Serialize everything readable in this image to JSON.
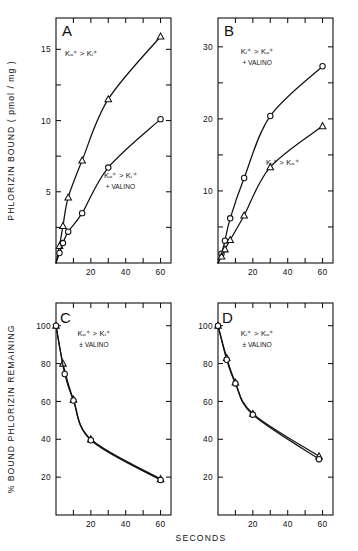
{
  "figure": {
    "x_axis_label": "SECONDS",
    "panels": [
      "A",
      "B",
      "C",
      "D"
    ]
  },
  "chart_data": [
    {
      "type": "line",
      "panel": "A",
      "title": "A",
      "xlabel": "SECONDS",
      "ylabel": "PHLORIZIN BOUND ( pmol / mg )",
      "xlim": [
        0,
        66
      ],
      "ylim": [
        0,
        17.2
      ],
      "xticks": [
        10,
        20,
        30,
        40,
        50,
        60
      ],
      "xticklabels": [
        "",
        "20",
        "",
        "40",
        "",
        "60"
      ],
      "yticks": [
        2.5,
        5,
        7.5,
        10,
        12.5,
        15
      ],
      "yticklabels": [
        "",
        "5",
        "",
        "10",
        "",
        "15"
      ],
      "grid": false,
      "legend": "none",
      "series": [
        {
          "name": "Kₒ⁺ > Kᵢ⁺",
          "marker": "triangle",
          "annotation": "Kₒ⁺ > Kᵢ⁺",
          "x": [
            0,
            2,
            4,
            7,
            15,
            30,
            60
          ],
          "y": [
            0,
            1.2,
            2.6,
            4.6,
            7.2,
            11.5,
            15.9
          ]
        },
        {
          "name": "Kₒ⁺ > Kᵢ⁺ + VALINO",
          "marker": "circle",
          "annotation": "Kₒ⁺ > Kᵢ⁺",
          "annotation2": "+ VALINO",
          "x": [
            0,
            2,
            4,
            7,
            15,
            30,
            60
          ],
          "y": [
            0,
            0.7,
            1.4,
            2.2,
            3.5,
            6.7,
            10.1
          ]
        }
      ]
    },
    {
      "type": "line",
      "panel": "B",
      "title": "B",
      "xlabel": "SECONDS",
      "ylabel": "PHLORIZIN BOUND ( pmol / mg )",
      "xlim": [
        0,
        66
      ],
      "ylim": [
        0,
        34
      ],
      "xticks": [
        10,
        20,
        30,
        40,
        50,
        60
      ],
      "xticklabels": [
        "",
        "20",
        "",
        "40",
        "",
        "60"
      ],
      "yticks": [
        5,
        10,
        15,
        20,
        25,
        30
      ],
      "yticklabels": [
        "",
        "10",
        "",
        "20",
        "",
        "30"
      ],
      "grid": false,
      "legend": "none",
      "series": [
        {
          "name": "Kᵢ⁺ > Kₒ⁺ + VALINO",
          "marker": "circle",
          "annotation": "Kᵢ⁺ > Kₒ⁺",
          "annotation2": "+ VALINO",
          "x": [
            0,
            2,
            4,
            7,
            15,
            30,
            60
          ],
          "y": [
            0,
            1.3,
            3.1,
            6.2,
            11.8,
            20.4,
            27.3
          ]
        },
        {
          "name": "Kᵢ⁺ > Kₒ⁺",
          "marker": "triangle",
          "annotation": "Kᵢ⁺ > Kₒ⁺",
          "x": [
            0,
            2,
            4,
            7,
            15,
            30,
            60
          ],
          "y": [
            0,
            0.9,
            1.9,
            3.2,
            6.6,
            13.3,
            19.0
          ]
        }
      ]
    },
    {
      "type": "line",
      "panel": "C",
      "title": "C",
      "xlabel": "SECONDS",
      "ylabel": "% BOUND PHLORIZIN REMAINING",
      "xlim": [
        0,
        66
      ],
      "ylim": [
        0,
        112
      ],
      "xticks": [
        10,
        20,
        30,
        40,
        50,
        60
      ],
      "xticklabels": [
        "",
        "20",
        "",
        "40",
        "",
        "60"
      ],
      "yticks": [
        20,
        40,
        60,
        80,
        100
      ],
      "yticklabels": [
        "20",
        "40",
        "60",
        "80",
        "100"
      ],
      "grid": false,
      "legend": "none",
      "series": [
        {
          "name": "Kₒ⁺ > Kᵢ⁺ ± VALINO (triangles)",
          "marker": "triangle",
          "annotation": "Kₒ⁺ > Kᵢ⁺",
          "annotation2": "± VALINO",
          "x": [
            0,
            4,
            10,
            20,
            60
          ],
          "y": [
            100,
            80,
            61,
            40,
            19
          ]
        },
        {
          "name": "Kₒ⁺ > Kᵢ⁺ ± VALINO (circles)",
          "marker": "circle",
          "x": [
            0,
            5,
            10,
            20,
            60
          ],
          "y": [
            100,
            74.5,
            60.5,
            39.5,
            18.5
          ]
        }
      ]
    },
    {
      "type": "line",
      "panel": "D",
      "title": "D",
      "xlabel": "SECONDS",
      "ylabel": "% BOUND PHLORIZIN REMAINING",
      "xlim": [
        0,
        66
      ],
      "ylim": [
        0,
        112
      ],
      "xticks": [
        10,
        20,
        30,
        40,
        50,
        60
      ],
      "xticklabels": [
        "",
        "20",
        "",
        "40",
        "",
        "60"
      ],
      "yticks": [
        20,
        40,
        60,
        80,
        100
      ],
      "yticklabels": [
        "20",
        "40",
        "60",
        "80",
        "100"
      ],
      "grid": false,
      "legend": "none",
      "series": [
        {
          "name": "Kᵢ⁺ > Kₒ⁺ ± VALINO (triangles)",
          "marker": "triangle",
          "annotation": "Kᵢ⁺ > Kₒ⁺",
          "annotation2": "± VALINO",
          "x": [
            0,
            5,
            10,
            20,
            58
          ],
          "y": [
            100,
            83,
            70,
            53.5,
            31
          ]
        },
        {
          "name": "Kᵢ⁺ > Kₒ⁺ ± VALINO (circles)",
          "marker": "circle",
          "x": [
            0,
            5,
            10,
            20,
            58
          ],
          "y": [
            100,
            82,
            69.5,
            53,
            29.5
          ]
        }
      ]
    }
  ]
}
